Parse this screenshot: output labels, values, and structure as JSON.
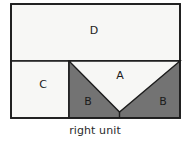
{
  "figure": {
    "caption": "right unit",
    "colors": {
      "light_fill": "#f7f7f5",
      "dark_fill": "#737373",
      "outline": "#1d1d1d",
      "background": "#ffffff",
      "label_text": "#1b1b1b",
      "caption_text": "#2a2a2a"
    },
    "outer_rect": {
      "x": 11,
      "y": 4,
      "width": 169,
      "height": 114
    },
    "dividers": {
      "horizontal_y": 61,
      "vertical_x": 69,
      "apex_x": 119,
      "apex_y": 112
    },
    "regions": [
      {
        "id": "D",
        "label": "D",
        "shade": "light",
        "label_x": 94,
        "label_y": 31
      },
      {
        "id": "C",
        "label": "C",
        "shade": "light",
        "label_x": 43,
        "label_y": 85
      },
      {
        "id": "A",
        "label": "A",
        "shade": "light",
        "label_x": 120,
        "label_y": 76
      },
      {
        "id": "B-left",
        "label": "B",
        "shade": "dark",
        "label_x": 88,
        "label_y": 102
      },
      {
        "id": "B-right",
        "label": "B",
        "shade": "dark",
        "label_x": 163,
        "label_y": 102
      }
    ],
    "caption_pos": {
      "x": 95,
      "y": 131
    }
  }
}
